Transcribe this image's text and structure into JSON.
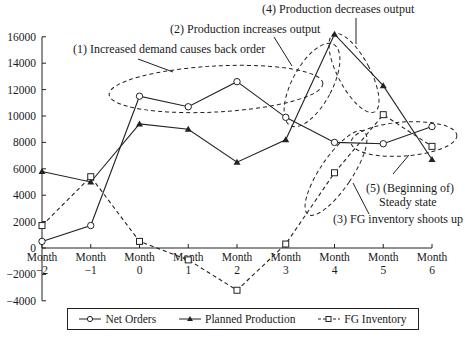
{
  "chart_data": {
    "type": "line",
    "title": "",
    "xlabel": "",
    "ylabel": "",
    "ylim": [
      -4000,
      16000
    ],
    "yticks": [
      16000,
      14000,
      12000,
      10000,
      8000,
      6000,
      4000,
      2000,
      0,
      -2000,
      -4000
    ],
    "grid": false,
    "legend_position": "bottom",
    "categories": [
      "Month −2",
      "Month −1",
      "Month 0",
      "Month 1",
      "Month 2",
      "Month 3",
      "Month 4",
      "Month 5",
      "Month 6"
    ],
    "tick_labels": [
      {
        "line1": "Month",
        "line2": "−2"
      },
      {
        "line1": "Month",
        "line2": "−1"
      },
      {
        "line1": "Month",
        "line2": "0"
      },
      {
        "line1": "Month",
        "line2": "1"
      },
      {
        "line1": "Month",
        "line2": "2"
      },
      {
        "line1": "Month",
        "line2": "3"
      },
      {
        "line1": "Month",
        "line2": "4"
      },
      {
        "line1": "Month",
        "line2": "5"
      },
      {
        "line1": "Month",
        "line2": "6"
      }
    ],
    "series": [
      {
        "name": "Net Orders",
        "marker": "circle-open",
        "line": "solid",
        "values": [
          500,
          1700,
          11500,
          10700,
          12600,
          9900,
          8000,
          7900,
          9200
        ]
      },
      {
        "name": "Planned Production",
        "marker": "triangle-filled",
        "line": "solid",
        "values": [
          5800,
          5000,
          9400,
          9000,
          6500,
          8200,
          16200,
          12300,
          6700
        ]
      },
      {
        "name": "FG Inventory",
        "marker": "square-open",
        "line": "dashed",
        "values": [
          1700,
          5400,
          500,
          -900,
          -3200,
          300,
          5700,
          10100,
          7700
        ]
      }
    ],
    "annotations": [
      {
        "id": 1,
        "text": "(1) Increased demand  causes back order"
      },
      {
        "id": 2,
        "text": "(2) Production increases output"
      },
      {
        "id": 3,
        "text": "(3) FG inventory shoots up"
      },
      {
        "id": 4,
        "text": "(4) Production decreases output"
      },
      {
        "id": 5,
        "text_line1": "(5) (Beginning of)",
        "text_line2": "Steady state"
      }
    ]
  },
  "legend": {
    "items": [
      "Net Orders",
      "Planned Production",
      "FG Inventory"
    ]
  }
}
